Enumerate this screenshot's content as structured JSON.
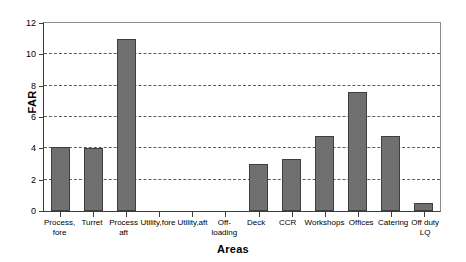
{
  "chart_data": {
    "type": "bar",
    "title": "",
    "xlabel": "Areas",
    "ylabel": "FAR",
    "ylim": [
      0,
      12
    ],
    "yticks": [
      0,
      2,
      4,
      6,
      8,
      10,
      12
    ],
    "ytick_labels": [
      "0",
      "2",
      "4",
      "6",
      "8",
      "10",
      "12"
    ],
    "grid": true,
    "grid_axis": "y",
    "legend": false,
    "bar_color": "#707070",
    "bar_edge_color": "#3f3f3f",
    "categories": [
      "Process, fore",
      "Turret",
      "Process aft",
      "Utility,fore",
      "Utility,aft",
      "Off-loading",
      "Deck",
      "CCR",
      "Workshops",
      "Offices",
      "Catering",
      "Off duty LQ"
    ],
    "category_lines": [
      [
        "Process,",
        "fore"
      ],
      [
        "Turret",
        ""
      ],
      [
        "Process",
        "aft"
      ],
      [
        "Utility,fore",
        ""
      ],
      [
        "Utility,aft",
        ""
      ],
      [
        "Off-loading",
        ""
      ],
      [
        "Deck",
        ""
      ],
      [
        "CCR",
        ""
      ],
      [
        "Workshops",
        ""
      ],
      [
        "Offices",
        ""
      ],
      [
        "Catering",
        ""
      ],
      [
        "Off duty",
        "LQ"
      ]
    ],
    "values": [
      4.1,
      4.0,
      11.0,
      0,
      0,
      0,
      3.0,
      3.3,
      4.8,
      7.6,
      4.8,
      0.5
    ]
  }
}
